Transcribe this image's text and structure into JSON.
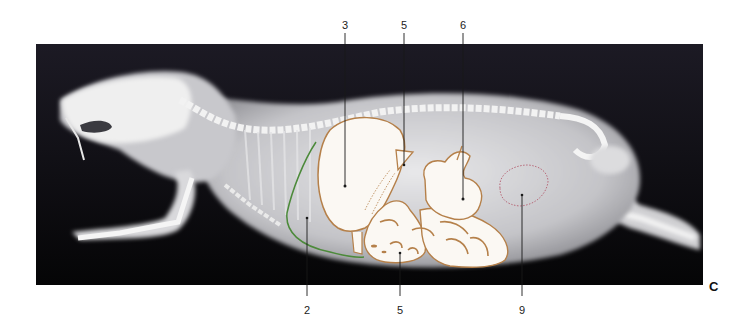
{
  "figure": {
    "panel_letter": "C",
    "image_bounds": {
      "x": 36,
      "y": 44,
      "width": 667,
      "height": 241
    },
    "colors": {
      "background": "#ffffff",
      "radiograph_dark": "#0b0b10",
      "organ_outline": "#b5804a",
      "diaphragm_line": "#4c8a3a",
      "dotted_outline": "#b86a7a",
      "leader_line": "#1a1a1a",
      "label_text": "#222222"
    },
    "labels_top": [
      {
        "id": "3",
        "text": "3",
        "x": 345,
        "y": 25,
        "point": {
          "x": 345,
          "y": 186
        }
      },
      {
        "id": "5a",
        "text": "5",
        "x": 404,
        "y": 25,
        "point": {
          "x": 404,
          "y": 165
        }
      },
      {
        "id": "6",
        "text": "6",
        "x": 463,
        "y": 25,
        "point": {
          "x": 463,
          "y": 199
        }
      }
    ],
    "labels_bottom": [
      {
        "id": "2",
        "text": "2",
        "x": 307,
        "y": 304,
        "point": {
          "x": 307,
          "y": 218
        }
      },
      {
        "id": "5b",
        "text": "5",
        "x": 400,
        "y": 304,
        "point": {
          "x": 400,
          "y": 253
        }
      },
      {
        "id": "9",
        "text": "9",
        "x": 522,
        "y": 304,
        "point": {
          "x": 522,
          "y": 195
        }
      }
    ]
  }
}
